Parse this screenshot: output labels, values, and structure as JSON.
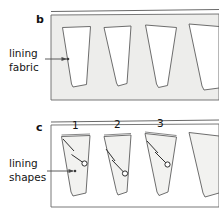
{
  "figure": {
    "type": "instructional-sewing-diagram",
    "background_color": "#ffffff",
    "line_color": "#4a4a4a",
    "panel_fill": "#ededeb",
    "shape_fill": "#ffffff",
    "text_color": "#141414"
  },
  "panels": [
    {
      "id": "panel-b",
      "letter": "b",
      "callout_label": "lining\nfabric",
      "description": "lining fabric sheet with wedge shapes marked out",
      "fill": "#ededeb",
      "shape_fill": "#ffffff",
      "shape_count": 4
    },
    {
      "id": "panel-c",
      "letter": "c",
      "callout_label": "lining\nshapes",
      "description": "cut lining shapes numbered with notch marks and circles",
      "fill": "#ffffff",
      "shape_fill": "#f2f2f0",
      "shape_count": 4,
      "shape_numbers": [
        "1",
        "2",
        "3"
      ]
    }
  ],
  "callouts": [
    {
      "id": "callout-lining-fabric",
      "text": "lining\nfabric",
      "target_panel": "panel-b"
    },
    {
      "id": "callout-lining-shapes",
      "text": "lining\nshapes",
      "target_panel": "panel-c"
    }
  ],
  "numbers": {
    "one": "1",
    "two": "2",
    "three": "3"
  }
}
